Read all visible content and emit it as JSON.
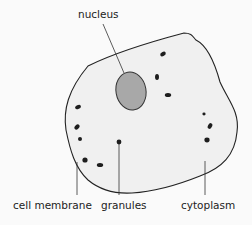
{
  "diagram": {
    "labels": {
      "nucleus": "nucleus",
      "cell_membrane": "cell membrane",
      "granules": "granules",
      "cytoplasm": "cytoplasm"
    },
    "colors": {
      "background": "#fafafa",
      "cell_fill": "#f0f0f0",
      "outline": "#222222",
      "nucleus_fill": "#a8a8a8",
      "granule": "#1e1e1e"
    }
  }
}
